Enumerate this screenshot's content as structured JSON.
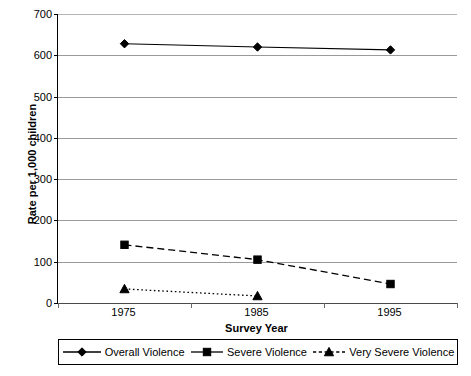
{
  "chart_data": {
    "type": "line",
    "title": "",
    "xlabel": "Survey Year",
    "ylabel": "Rate per 1,000 children",
    "categories": [
      "1975",
      "1985",
      "1995"
    ],
    "ylim": [
      0,
      700
    ],
    "yticks": [
      0,
      100,
      200,
      300,
      400,
      500,
      600,
      700
    ],
    "ytick_labels": [
      "0",
      "100",
      "200",
      "300",
      "400",
      "500",
      "600",
      "700"
    ],
    "grid": true,
    "legend_position": "bottom",
    "series": [
      {
        "name": "Overall Violence",
        "marker": "diamond",
        "linestyle": "solid",
        "color": "#000000",
        "values": [
          628,
          620,
          613
        ]
      },
      {
        "name": "Severe Violence",
        "marker": "square",
        "linestyle": "dashed",
        "color": "#000000",
        "values": [
          141,
          105,
          46
        ]
      },
      {
        "name": "Very Severe Violence",
        "marker": "triangle",
        "linestyle": "dotted",
        "color": "#000000",
        "values": [
          34,
          17,
          null
        ]
      }
    ]
  },
  "legend": {
    "items": [
      {
        "label": "Overall Violence",
        "marker": "diamond-marker-icon"
      },
      {
        "label": "Severe Violence",
        "marker": "square-marker-icon"
      },
      {
        "label": "Very Severe Violence",
        "marker": "triangle-marker-icon"
      }
    ]
  },
  "axes": {
    "y_title": "Rate per 1,000 children",
    "x_title": "Survey Year"
  },
  "colors": {
    "line": "#000000",
    "gridline": "#9a9a9a",
    "axis": "#000000",
    "background": "#ffffff"
  }
}
